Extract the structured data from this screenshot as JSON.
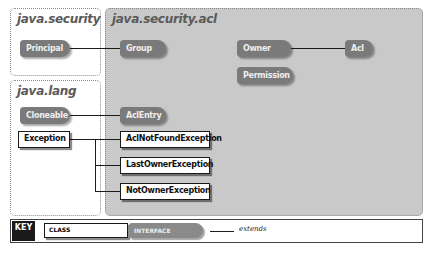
{
  "packages": {
    "security": {
      "title": "java.security"
    },
    "acl": {
      "title": "java.security.acl"
    },
    "lang": {
      "title": "java.lang"
    }
  },
  "nodes": {
    "principal": {
      "label": "Principal",
      "kind": "interface",
      "package": "java.security"
    },
    "group": {
      "label": "Group",
      "kind": "interface",
      "package": "java.security.acl"
    },
    "owner": {
      "label": "Owner",
      "kind": "interface",
      "package": "java.security.acl"
    },
    "acl": {
      "label": "Acl",
      "kind": "interface",
      "package": "java.security.acl"
    },
    "permission": {
      "label": "Permission",
      "kind": "interface",
      "package": "java.security.acl"
    },
    "cloneable": {
      "label": "Cloneable",
      "kind": "interface",
      "package": "java.lang"
    },
    "aclentry": {
      "label": "AclEntry",
      "kind": "interface",
      "package": "java.security.acl"
    },
    "exception": {
      "label": "Exception",
      "kind": "class",
      "package": "java.lang"
    },
    "aclnotfound": {
      "label": "AclNotFoundException",
      "kind": "class",
      "package": "java.security.acl"
    },
    "lastowner": {
      "label": "LastOwnerException",
      "kind": "class",
      "package": "java.security.acl"
    },
    "notowner": {
      "label": "NotOwnerException",
      "kind": "class",
      "package": "java.security.acl"
    }
  },
  "edges": [
    {
      "from": "Principal",
      "to": "Group",
      "type": "extends"
    },
    {
      "from": "Owner",
      "to": "Acl",
      "type": "extends"
    },
    {
      "from": "Cloneable",
      "to": "AclEntry",
      "type": "extends"
    },
    {
      "from": "Exception",
      "to": "AclNotFoundException",
      "type": "extends"
    },
    {
      "from": "Exception",
      "to": "LastOwnerException",
      "type": "extends"
    },
    {
      "from": "Exception",
      "to": "NotOwnerException",
      "type": "extends"
    }
  ],
  "key": {
    "label": "KEY",
    "class_label": "CLASS",
    "interface_label": "INTERFACE",
    "extends_label": "extends"
  },
  "colors": {
    "acl_package_bg": "#c9c9c9",
    "interface_fill": "#7a7a7a",
    "class_fill": "#ffffff",
    "line": "#1a1a1a"
  }
}
